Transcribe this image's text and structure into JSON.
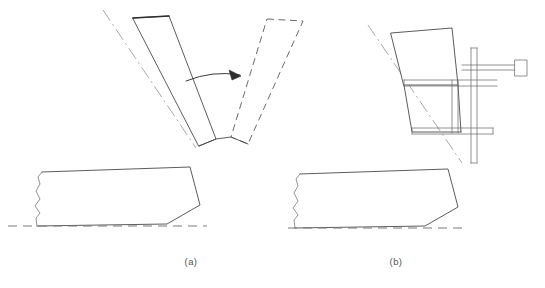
{
  "figure": {
    "type": "technical-line-drawing",
    "background_color": "#ffffff",
    "line_color": "#4a4a4a",
    "thick_line_color": "#2e2e2e",
    "dashed_line_color": "#5a5a5a",
    "centerline_color": "#9a9a9a",
    "label_color": "#555555",
    "panels": [
      {
        "id": "panel-a",
        "caption": "(a)",
        "caption_x": 191,
        "caption_y": 265,
        "elements": [
          "bending-arm-solid",
          "bending-arm-dashed",
          "rotation-arc-arrow",
          "centerline",
          "workpiece-profile",
          "datum-line"
        ]
      },
      {
        "id": "panel-b",
        "caption": "(b)",
        "caption_x": 396,
        "caption_y": 265,
        "elements": [
          "blade-quadrilateral",
          "clamp-frame",
          "horizontal-rod",
          "rod-end-block",
          "vertical-post-left",
          "vertical-post-right",
          "centerline",
          "workpiece-profile",
          "datum-line"
        ]
      }
    ],
    "geometry": {
      "panel_a": {
        "arm_solid": "M133,18 L169,16 L216,139 L199,146 Z",
        "arm_solid_top_edge": "M133,18 L169,16",
        "arm_dashed": "M267,19 L303,21 L248,144 L231,137 Z",
        "arm_dashed_top_edge": "M267,19 L303,21",
        "arm_base_connector": "M199,146 L216,139 L231,137 L248,144",
        "centerline": "M103,10 L196,148",
        "arc": "M186,81 Q213,70 240,75",
        "arrow_head": "M240,75 L231,71 L233,79 Z",
        "workpiece_top": "M42,172 L190,167",
        "workpiece_right": "M190,167 L200,205",
        "workpiece_lower_right": "M200,205 L167,224",
        "workpiece_bottom": "M167,224 L37,226",
        "workpiece_left_break": "M37,226 L36,218 L40,213 L35,206 L40,199 L36,191 L40,184 L38,177 L42,172",
        "datum": "M8,226 L207,226"
      },
      "panel_b": {
        "blade": "M391,33 L452,28 L458,85 L404,85 Z",
        "blade_lower": "M404,85 L412,132 L461,132",
        "blade_fold": "M458,85 L461,132",
        "centerline": "M368,25 L462,163",
        "rod": "M462,65 L515,65 M462,70 L515,70",
        "rod_end_block": "M515,60 L527,60 L527,76 L515,76 Z",
        "upper_bar": "M404,80 L496,80 M404,86 L496,86",
        "lower_bar": "M412,128 L492,128 M412,134 L492,134",
        "post_left": "M452,80 L452,133 M458,80 L458,133",
        "post_right": "M471,48 L471,163 M477,48 L477,163",
        "workpiece_top": "M300,174 L448,169",
        "workpiece_right": "M448,169 L458,207",
        "workpiece_lower_right": "M458,207 L425,226",
        "workpiece_bottom": "M425,226 L295,228",
        "workpiece_left_break": "M295,228 L294,220 L298,215 L293,208 L298,201 L294,193 L298,186 L296,179 L300,174",
        "datum": "M288,228 L466,228"
      }
    }
  }
}
